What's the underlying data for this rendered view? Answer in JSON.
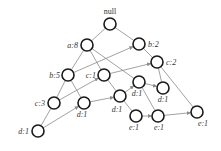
{
  "diagram": {
    "type": "tree-graph",
    "colors": {
      "node_stroke": "#1a1a1a",
      "edge": "#8a8a8a",
      "text": "#333333",
      "background": "#ffffff"
    },
    "nodes": [
      {
        "id": "root",
        "label": "null",
        "x": 110,
        "y": 24,
        "lx": 110,
        "ly": 14,
        "anchor": "middle"
      },
      {
        "id": "a8",
        "label": "a:8",
        "x": 87,
        "y": 45,
        "lx": 78,
        "ly": 48,
        "anchor": "end"
      },
      {
        "id": "b2",
        "label": "b:2",
        "x": 139,
        "y": 44,
        "lx": 148,
        "ly": 47,
        "anchor": "start"
      },
      {
        "id": "c2",
        "label": "c:2",
        "x": 157,
        "y": 62,
        "lx": 166,
        "ly": 65,
        "anchor": "start"
      },
      {
        "id": "b5",
        "label": "b:5",
        "x": 68,
        "y": 75,
        "lx": 60,
        "ly": 78,
        "anchor": "end"
      },
      {
        "id": "c1",
        "label": "c:1",
        "x": 104,
        "y": 75,
        "lx": 96,
        "ly": 78,
        "anchor": "end"
      },
      {
        "id": "d1a",
        "label": "d:1",
        "x": 139,
        "y": 82,
        "lx": 137,
        "ly": 96,
        "anchor": "middle"
      },
      {
        "id": "d1b",
        "label": "d:1",
        "x": 163,
        "y": 88,
        "lx": 163,
        "ly": 102,
        "anchor": "middle"
      },
      {
        "id": "c3",
        "label": "c:3",
        "x": 54,
        "y": 103,
        "lx": 45,
        "ly": 106,
        "anchor": "end"
      },
      {
        "id": "d1c",
        "label": "d:1",
        "x": 84,
        "y": 103,
        "lx": 82,
        "ly": 117,
        "anchor": "middle"
      },
      {
        "id": "d1d",
        "label": "d:1",
        "x": 120,
        "y": 96,
        "lx": 117,
        "ly": 112,
        "anchor": "middle"
      },
      {
        "id": "e1a",
        "label": "e:1",
        "x": 136,
        "y": 116,
        "lx": 134,
        "ly": 130,
        "anchor": "middle"
      },
      {
        "id": "e1b",
        "label": "e:1",
        "x": 158,
        "y": 116,
        "lx": 159,
        "ly": 130,
        "anchor": "middle"
      },
      {
        "id": "e1c",
        "label": "e:1",
        "x": 197,
        "y": 112,
        "lx": 203,
        "ly": 126,
        "anchor": "middle"
      },
      {
        "id": "d1e",
        "label": "d:1",
        "x": 38,
        "y": 131,
        "lx": 29,
        "ly": 134,
        "anchor": "end"
      }
    ],
    "edges": [
      {
        "from": "root",
        "to": "a8",
        "arrow": false
      },
      {
        "from": "root",
        "to": "b2",
        "arrow": false
      },
      {
        "from": "a8",
        "to": "b5",
        "arrow": false
      },
      {
        "from": "a8",
        "to": "c1",
        "arrow": false
      },
      {
        "from": "a8",
        "to": "d1a",
        "arrow": false
      },
      {
        "from": "b2",
        "to": "c2",
        "arrow": false
      },
      {
        "from": "b5",
        "to": "b2",
        "arrow": true
      },
      {
        "from": "b5",
        "to": "c3",
        "arrow": false
      },
      {
        "from": "b5",
        "to": "d1c",
        "arrow": false
      },
      {
        "from": "c1",
        "to": "c2",
        "arrow": true
      },
      {
        "from": "c1",
        "to": "d1d",
        "arrow": false
      },
      {
        "from": "c2",
        "to": "d1b",
        "arrow": false
      },
      {
        "from": "c2",
        "to": "e1c",
        "arrow": false
      },
      {
        "from": "d1a",
        "to": "d1b",
        "arrow": true
      },
      {
        "from": "d1a",
        "to": "e1b",
        "arrow": false
      },
      {
        "from": "c3",
        "to": "c1",
        "arrow": true
      },
      {
        "from": "c3",
        "to": "d1e",
        "arrow": false
      },
      {
        "from": "d1e",
        "to": "d1c",
        "arrow": true
      },
      {
        "from": "d1c",
        "to": "d1d",
        "arrow": true
      },
      {
        "from": "d1d",
        "to": "d1a",
        "arrow": true
      },
      {
        "from": "d1d",
        "to": "e1a",
        "arrow": false
      },
      {
        "from": "e1a",
        "to": "e1b",
        "arrow": true
      },
      {
        "from": "e1b",
        "to": "e1c",
        "arrow": true
      }
    ]
  }
}
